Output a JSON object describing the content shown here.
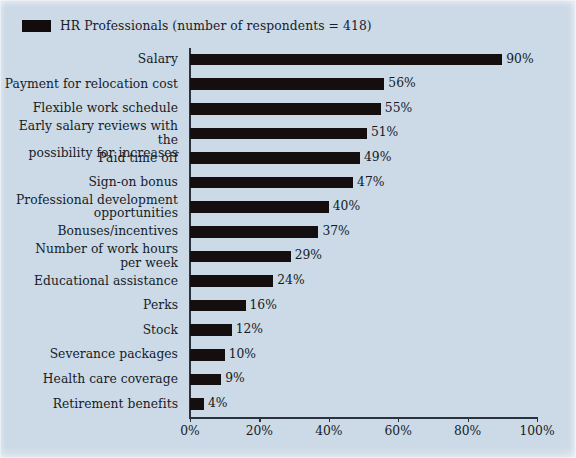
{
  "legend": {
    "marker_color": "#140f0e",
    "label": "HR Professionals (number of respondents = 418)"
  },
  "axis": {
    "ticks": [
      "0%",
      "20%",
      "40%",
      "60%",
      "80%",
      "100%"
    ]
  },
  "chart_data": {
    "type": "bar",
    "orientation": "horizontal",
    "title": "",
    "subtitle": "",
    "xlabel": "",
    "ylabel": "",
    "xlim": [
      0,
      100
    ],
    "xticks": [
      0,
      20,
      40,
      60,
      80,
      100
    ],
    "xtick_labels": [
      "0%",
      "20%",
      "40%",
      "60%",
      "80%",
      "100%"
    ],
    "grid": false,
    "legend_position": "top-left",
    "bar_color": "#140f0e",
    "background_color": "#ccd9e6",
    "series": [
      {
        "name": "HR Professionals (number of respondents = 418)",
        "values": [
          90,
          56,
          55,
          51,
          49,
          47,
          40,
          37,
          29,
          24,
          16,
          12,
          10,
          9,
          4
        ]
      }
    ],
    "categories": [
      "Salary",
      "Payment for relocation cost",
      "Flexible work schedule",
      "Early salary reviews with the possibility for increases",
      "Paid time off",
      "Sign-on bonus",
      "Professional development opportunities",
      "Bonuses/incentives",
      "Number of work hours per week",
      "Educational assistance",
      "Perks",
      "Stock",
      "Severance packages",
      "Health care coverage",
      "Retirement benefits"
    ],
    "category_lines": [
      [
        "Salary"
      ],
      [
        "Payment for relocation cost"
      ],
      [
        "Flexible work schedule"
      ],
      [
        "Early salary reviews with the",
        "possibility for increases"
      ],
      [
        "Paid time off"
      ],
      [
        "Sign-on bonus"
      ],
      [
        "Professional development",
        "opportunities"
      ],
      [
        "Bonuses/incentives"
      ],
      [
        "Number of work hours",
        "per week"
      ],
      [
        "Educational assistance"
      ],
      [
        "Perks"
      ],
      [
        "Stock"
      ],
      [
        "Severance packages"
      ],
      [
        "Health care coverage"
      ],
      [
        "Retirement benefits"
      ]
    ],
    "value_labels": [
      "90%",
      "56%",
      "55%",
      "51%",
      "49%",
      "47%",
      "40%",
      "37%",
      "29%",
      "24%",
      "16%",
      "12%",
      "10%",
      "9%",
      "4%"
    ]
  }
}
